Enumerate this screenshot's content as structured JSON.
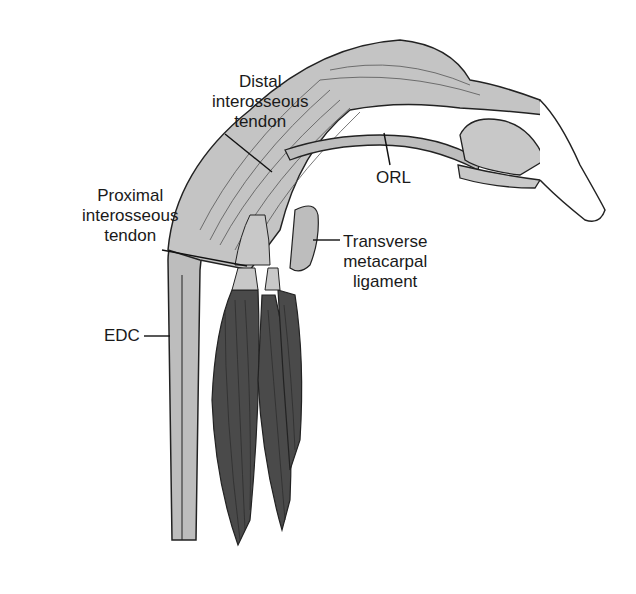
{
  "figure": {
    "colors": {
      "tendon": "#bdbdbd",
      "tendon_light": "#d6d6d6",
      "muscle": "#4a4a4a",
      "outline": "#222222",
      "bone": "#ffffff"
    }
  },
  "labels": {
    "distal_interosseous_tendon": {
      "line1": "Distal",
      "line2": "interosseous",
      "line3": "tendon"
    },
    "orl": {
      "text": "ORL"
    },
    "proximal_interosseous_tendon": {
      "line1": "Proximal",
      "line2": "interosseous",
      "line3": "tendon"
    },
    "transverse_metacarpal_ligament": {
      "line1": "Transverse",
      "line2": "metacarpal",
      "line3": "ligament"
    },
    "edc": {
      "text": "EDC"
    }
  }
}
